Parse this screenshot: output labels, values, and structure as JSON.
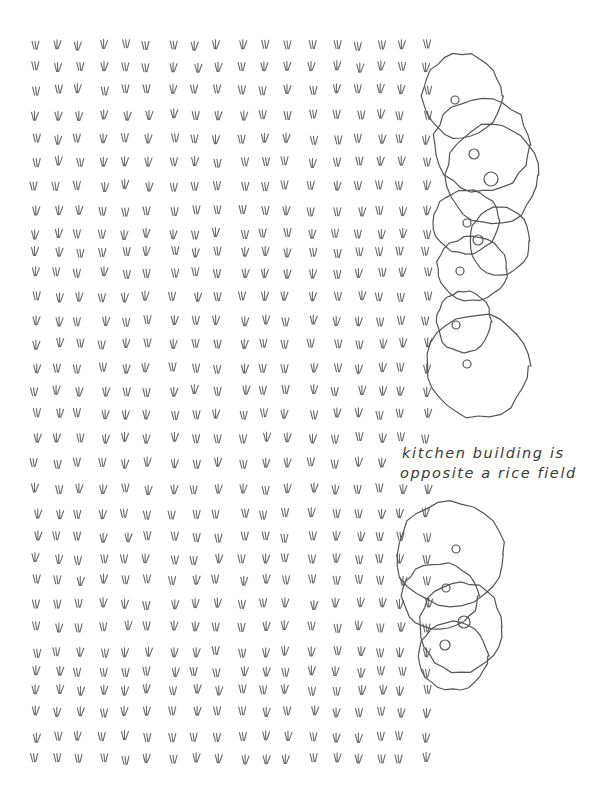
{
  "illustration": {
    "caption_lines": [
      "kitchen building is",
      "opposite a rice field"
    ],
    "ink_color": "#555555",
    "rice_mark_color": "#6a6a6a",
    "background": "#ffffff"
  },
  "rice_field": {
    "row_y": [
      45,
      67,
      90,
      115,
      139,
      162,
      186,
      211,
      234,
      252,
      273,
      297,
      321,
      344,
      368,
      391,
      414,
      438,
      463,
      489,
      514,
      537,
      559,
      580,
      604,
      627,
      652,
      672,
      690,
      712,
      737,
      759
    ],
    "col_x": [
      36,
      58,
      79,
      104,
      126,
      147,
      174,
      196,
      217,
      244,
      265,
      286,
      313,
      337,
      360,
      381,
      401,
      427
    ],
    "right_edge_cols_by_row": {
      "default": 18
    }
  },
  "blobs_top": [
    {
      "cx": 462,
      "cy": 96,
      "rx": 40,
      "ry": 42,
      "dot": {
        "x": 455,
        "y": 100,
        "r": 4
      }
    },
    {
      "cx": 482,
      "cy": 145,
      "rx": 48,
      "ry": 47,
      "dot": {
        "x": 474,
        "y": 154,
        "r": 5
      }
    },
    {
      "cx": 492,
      "cy": 175,
      "rx": 46,
      "ry": 50,
      "dot": {
        "x": 491,
        "y": 179,
        "r": 7
      }
    },
    {
      "cx": 466,
      "cy": 222,
      "rx": 33,
      "ry": 32,
      "dot": {
        "x": 467,
        "y": 223,
        "r": 4
      }
    },
    {
      "cx": 500,
      "cy": 241,
      "rx": 30,
      "ry": 34,
      "dot": {
        "x": 478,
        "y": 240,
        "r": 5
      }
    },
    {
      "cx": 472,
      "cy": 269,
      "rx": 35,
      "ry": 32,
      "dot": {
        "x": 460,
        "y": 271,
        "r": 4
      }
    },
    {
      "cx": 464,
      "cy": 322,
      "rx": 27,
      "ry": 31,
      "dot": {
        "x": 456,
        "y": 325,
        "r": 4
      }
    },
    {
      "cx": 478,
      "cy": 366,
      "rx": 51,
      "ry": 52,
      "dot": {
        "x": 467,
        "y": 364,
        "r": 4
      }
    }
  ],
  "blobs_bottom": [
    {
      "cx": 450,
      "cy": 554,
      "rx": 54,
      "ry": 52,
      "dot": {
        "x": 456,
        "y": 549,
        "r": 4
      }
    },
    {
      "cx": 440,
      "cy": 596,
      "rx": 38,
      "ry": 33,
      "dot": {
        "x": 446,
        "y": 588,
        "r": 4
      }
    },
    {
      "cx": 461,
      "cy": 627,
      "rx": 41,
      "ry": 45,
      "dot": {
        "x": 464,
        "y": 622,
        "r": 6
      }
    },
    {
      "cx": 453,
      "cy": 656,
      "rx": 35,
      "ry": 34,
      "dot": {
        "x": 445,
        "y": 645,
        "r": 5
      }
    }
  ]
}
